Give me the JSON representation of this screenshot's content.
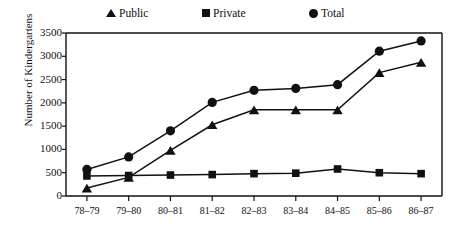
{
  "chart_data": {
    "type": "line",
    "title": "",
    "xlabel": "",
    "ylabel": "Number of Kindergartens",
    "categories": [
      "78–79",
      "79–80",
      "80–81",
      "81–82",
      "82–83",
      "83–84",
      "84–85",
      "85–86",
      "86–87"
    ],
    "series": [
      {
        "name": "Public",
        "marker": "triangle",
        "values": [
          170,
          400,
          980,
          1530,
          1850,
          1850,
          1850,
          2650,
          2870
        ]
      },
      {
        "name": "Private",
        "marker": "square",
        "values": [
          430,
          440,
          450,
          460,
          480,
          490,
          580,
          500,
          480
        ]
      },
      {
        "name": "Total",
        "marker": "circle",
        "values": [
          570,
          840,
          1400,
          2010,
          2270,
          2310,
          2390,
          3110,
          3330
        ]
      }
    ],
    "ylim": [
      0,
      3500
    ],
    "yticks": [
      0,
      500,
      1000,
      1500,
      2000,
      2500,
      3000,
      3500
    ],
    "ytick_labels": [
      "0",
      "500",
      "1000",
      "1500",
      "2000",
      "2500",
      "3000",
      "3500"
    ],
    "grid": false,
    "legend_position": "top",
    "line_color": "#111111",
    "marker_color": "#111111",
    "axis_color": "#111111"
  },
  "legend": {
    "items": [
      {
        "label": "Public",
        "icon": "triangle-marker-icon"
      },
      {
        "label": "Private",
        "icon": "square-marker-icon"
      },
      {
        "label": "Total",
        "icon": "circle-marker-icon"
      }
    ]
  },
  "axes": {
    "y_title": "Number of Kindergartens"
  }
}
